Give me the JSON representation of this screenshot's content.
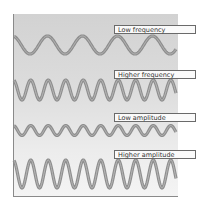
{
  "figure": {
    "labels": {
      "low_frequency": "Low frequency",
      "higher_frequency": "Higher frequency",
      "low_amplitude": "Low amplitude",
      "higher_amplitude": "Higher amplitude"
    },
    "colors": {
      "wave": "#8e8e8e",
      "wave_highlight": "#b8b8b8",
      "panel_top": "#d2d2d2",
      "panel_bottom": "#f4f4f4"
    },
    "waves": [
      {
        "name": "low-frequency",
        "center_y": 45,
        "amplitude": 9,
        "period": 35,
        "phase_x": 30
      },
      {
        "name": "higher-frequency",
        "center_y": 90,
        "amplitude": 10,
        "period": 17.5,
        "phase_x": 22
      },
      {
        "name": "low-amplitude",
        "center_y": 130.5,
        "amplitude": 5,
        "period": 17.5,
        "phase_x": 22
      },
      {
        "name": "higher-amplitude",
        "center_y": 174,
        "amplitude": 14,
        "period": 17.5,
        "phase_x": 22
      }
    ]
  }
}
